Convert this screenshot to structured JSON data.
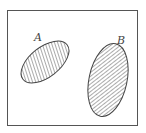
{
  "diagram": {
    "type": "venn",
    "colors": {
      "stroke": "#444444",
      "hatch": "#444444",
      "background": "#ffffff"
    },
    "sets": [
      {
        "label": "A",
        "hatch": "steep-diagonal"
      },
      {
        "label": "B",
        "hatch": "diagonal"
      }
    ]
  }
}
